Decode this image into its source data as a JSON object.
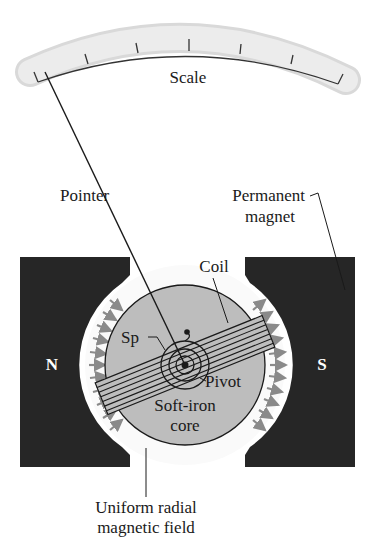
{
  "figure": {
    "labels": {
      "scale": "Scale",
      "pointer": "Pointer",
      "permanent_magnet_line1": "Permanent",
      "permanent_magnet_line2": "magnet",
      "coil": "Coil",
      "spring": "Sp",
      "pivot": "Pivot",
      "core_line1": "Soft-iron",
      "core_line2": "core",
      "field_line1": "Uniform radial",
      "field_line2": "magnetic field",
      "north_pole": "N",
      "south_pole": "S"
    },
    "colors": {
      "magnet": "#262626",
      "core": "#bdbdbd",
      "scale_band": "#e6e6e6",
      "field_arrows": "#8a8a8a",
      "lines": "#1a1a1a"
    },
    "scale_ticks": 7
  }
}
